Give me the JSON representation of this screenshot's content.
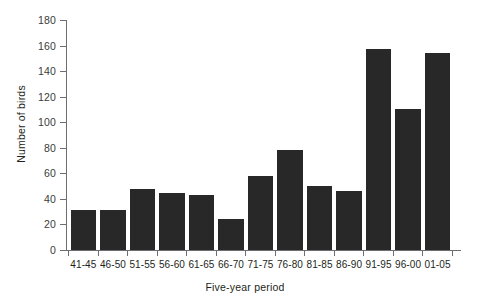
{
  "chart_data": {
    "type": "bar",
    "title": "",
    "xlabel": "Five-year period",
    "ylabel": "Number of birds",
    "categories": [
      "41-45",
      "46-50",
      "51-55",
      "56-60",
      "61-65",
      "66-70",
      "71-75",
      "76-80",
      "81-85",
      "86-90",
      "91-95",
      "96-00",
      "01-05"
    ],
    "values": [
      31,
      31,
      48,
      45,
      43,
      24,
      58,
      78,
      50,
      46,
      157,
      110,
      154
    ],
    "ylim": [
      0,
      180
    ],
    "yticks": [
      0,
      20,
      40,
      60,
      80,
      100,
      120,
      140,
      160,
      180
    ],
    "ytick_labels": [
      "0",
      "20",
      "40",
      "60",
      "80",
      "100",
      "120",
      "140",
      "160",
      "180"
    ],
    "grid": false,
    "legend": "none",
    "bar_color": "#282828",
    "axis_color": "#6d6e71",
    "background": "#ffffff"
  }
}
